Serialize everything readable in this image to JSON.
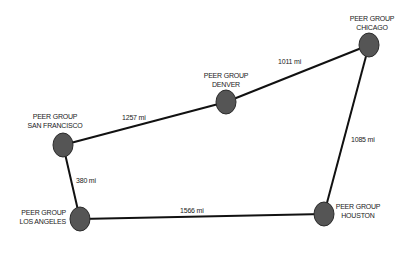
{
  "diagram": {
    "style": {
      "node_fill": "#555555",
      "node_stroke": "#2a2a2a",
      "edge_color": "#111111",
      "background": "#ffffff"
    },
    "nodes": [
      {
        "id": "sf",
        "line1": "PEER GROUP",
        "line2": "SAN FRANCISCO",
        "x": 63,
        "y": 145
      },
      {
        "id": "la",
        "line1": "PEER GROUP",
        "line2": "LOS ANGELES",
        "x": 80,
        "y": 219
      },
      {
        "id": "denver",
        "line1": "PEER GROUP",
        "line2": "DENVER",
        "x": 226,
        "y": 102
      },
      {
        "id": "chicago",
        "line1": "PEER GROUP",
        "line2": "CHICAGO",
        "x": 369,
        "y": 45
      },
      {
        "id": "houston",
        "line1": "PEER GROUP",
        "line2": "HOUSTON",
        "x": 324,
        "y": 214
      }
    ],
    "edges": [
      {
        "from": "sf",
        "to": "denver",
        "label": "1257 mi"
      },
      {
        "from": "denver",
        "to": "chicago",
        "label": "1011 mi"
      },
      {
        "from": "sf",
        "to": "la",
        "label": "380 mi"
      },
      {
        "from": "chicago",
        "to": "houston",
        "label": "1085 mi"
      },
      {
        "from": "la",
        "to": "houston",
        "label": "1566 mi"
      }
    ]
  }
}
